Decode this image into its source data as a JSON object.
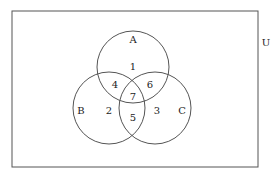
{
  "diagram": {
    "type": "venn",
    "universe_label": "U",
    "sets": [
      {
        "label": "A"
      },
      {
        "label": "B"
      },
      {
        "label": "C"
      }
    ],
    "regions": [
      {
        "id": "only_A",
        "label": "1"
      },
      {
        "id": "only_B",
        "label": "2"
      },
      {
        "id": "only_C",
        "label": "3"
      },
      {
        "id": "A_and_B",
        "label": "4"
      },
      {
        "id": "B_and_C",
        "label": "5"
      },
      {
        "id": "A_and_C",
        "label": "6"
      },
      {
        "id": "A_B_C",
        "label": "7"
      }
    ],
    "stroke_color": "#555555"
  }
}
